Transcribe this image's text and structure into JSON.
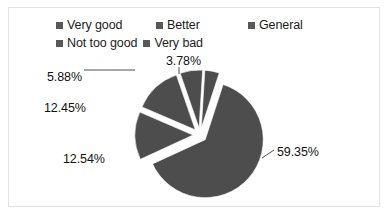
{
  "legend": {
    "rows": [
      [
        {
          "label": "Very good",
          "swatch": "#585858",
          "icon": "legend-swatch-icon"
        },
        {
          "label": "Better",
          "swatch": "#585858",
          "icon": "legend-swatch-icon"
        },
        {
          "label": "General",
          "swatch": "#585858",
          "icon": "legend-swatch-icon"
        }
      ],
      [
        {
          "label": "Not too good",
          "swatch": "#585858",
          "icon": "legend-swatch-icon"
        },
        {
          "label": "Very bad",
          "swatch": "#585858",
          "icon": "legend-swatch-icon"
        }
      ]
    ]
  },
  "labels": {
    "l0": "59.35%",
    "l1": "12.54%",
    "l2": "12.45%",
    "l3": "5.88%",
    "l4": "3.78%"
  },
  "chart_data": {
    "type": "pie",
    "title": "",
    "subtitle": "",
    "xlabel": "",
    "ylabel": "",
    "legend_position": "top",
    "grid": false,
    "exploded": true,
    "value_unit": "percent",
    "slice_color": "#4d4d4d",
    "categories": [
      "Very good",
      "Better",
      "General",
      "Not too good",
      "Very bad"
    ],
    "values": [
      59.35,
      12.54,
      12.45,
      5.88,
      3.78
    ],
    "data_labels": [
      "59.35%",
      "12.54%",
      "12.45%",
      "5.88%",
      "3.78%"
    ],
    "series": [
      {
        "name": "Evaluation",
        "values": [
          59.35,
          12.54,
          12.45,
          5.88,
          3.78
        ]
      }
    ],
    "slices": [
      {
        "label": "Very good",
        "value": 59.35,
        "data_label": "59.35%",
        "color": "#4d4d4d"
      },
      {
        "label": "Better",
        "value": 12.54,
        "data_label": "12.54%",
        "color": "#4d4d4d"
      },
      {
        "label": "General",
        "value": 12.45,
        "data_label": "12.45%",
        "color": "#4d4d4d"
      },
      {
        "label": "Not too good",
        "value": 5.88,
        "data_label": "5.88%",
        "color": "#4d4d4d"
      },
      {
        "label": "Very bad",
        "value": 3.78,
        "data_label": "3.78%",
        "color": "#4d4d4d"
      }
    ],
    "total": 94.0
  }
}
